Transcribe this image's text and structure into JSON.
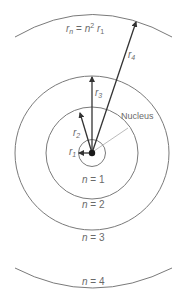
{
  "diagram": {
    "title_formula": {
      "r": "r",
      "n_sub": "n",
      "eq": " = ",
      "n": "n",
      "sup": "2",
      "r1": "r",
      "sub1": "1"
    },
    "nucleus_label": "Nucleus",
    "radii_labels": [
      {
        "name": "r",
        "sub": "1"
      },
      {
        "name": "r",
        "sub": "2"
      },
      {
        "name": "r",
        "sub": "3"
      },
      {
        "name": "r",
        "sub": "4"
      }
    ],
    "orbit_labels": [
      {
        "n": "n",
        "eq": " = 1"
      },
      {
        "n": "n",
        "eq": " = 2"
      },
      {
        "n": "n",
        "eq": " = 3"
      },
      {
        "n": "n",
        "eq": " = 4"
      }
    ],
    "colors": {
      "line": "#7a7a7a",
      "arrow": "#333333",
      "nucleus": "#1a1a1a",
      "text": "#6a6a6a"
    }
  }
}
